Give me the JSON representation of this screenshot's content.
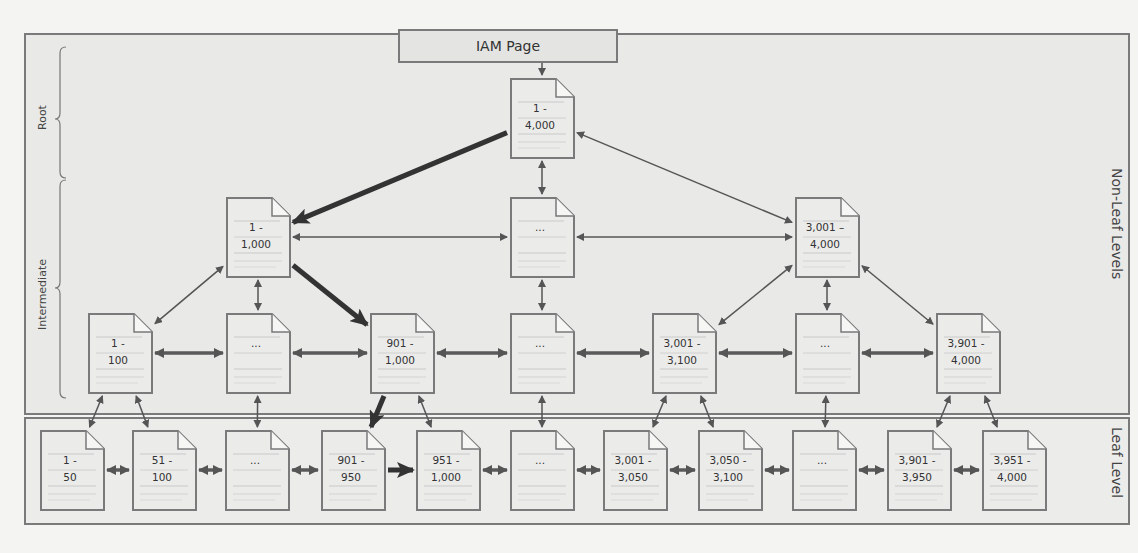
{
  "iam_page": {
    "label": "IAM Page"
  },
  "sections": {
    "non_leaf": "Non-Leaf Levels",
    "leaf": "Leaf Level",
    "root_brace": "Root",
    "intermediate_brace": "Intermediate"
  },
  "colors": {
    "border": "#7a7a7a",
    "panel": "#e9e9e7",
    "page_fill": "#ebebea",
    "arrow": "#555555",
    "bold_arrow": "#333333"
  },
  "nodes": {
    "root": {
      "label": "1 -\n4,000",
      "x": 510,
      "y": 78
    },
    "int1_a": {
      "label": "1 -\n1,000",
      "x": 226,
      "y": 197
    },
    "int1_b": {
      "label": "...",
      "x": 510,
      "y": 197
    },
    "int1_c": {
      "label": "3,001 –\n4,000",
      "x": 795,
      "y": 197
    },
    "int2_a": {
      "label": "1 -\n100",
      "x": 88,
      "y": 313
    },
    "int2_b": {
      "label": "...",
      "x": 226,
      "y": 313
    },
    "int2_c": {
      "label": "901 -\n1,000",
      "x": 370,
      "y": 313
    },
    "int2_d": {
      "label": "...",
      "x": 510,
      "y": 313
    },
    "int2_e": {
      "label": "3,001 -\n3,100",
      "x": 652,
      "y": 313
    },
    "int2_f": {
      "label": "...",
      "x": 795,
      "y": 313
    },
    "int2_g": {
      "label": "3,901 -\n4,000",
      "x": 936,
      "y": 313
    },
    "leaf_1": {
      "label": "1 -\n50",
      "x": 40,
      "y": 430
    },
    "leaf_2": {
      "label": "51 -\n100",
      "x": 132,
      "y": 430
    },
    "leaf_3": {
      "label": "...",
      "x": 225,
      "y": 430
    },
    "leaf_4": {
      "label": "901 -\n950",
      "x": 321,
      "y": 430
    },
    "leaf_5": {
      "label": "951 -\n1,000",
      "x": 416,
      "y": 430
    },
    "leaf_6": {
      "label": "...",
      "x": 510,
      "y": 430
    },
    "leaf_7": {
      "label": "3,001 -\n3,050",
      "x": 603,
      "y": 430
    },
    "leaf_8": {
      "label": "3,050 -\n3,100",
      "x": 698,
      "y": 430
    },
    "leaf_9": {
      "label": "...",
      "x": 792,
      "y": 430
    },
    "leaf_10": {
      "label": "3,901 -\n3,950",
      "x": 887,
      "y": 430
    },
    "leaf_11": {
      "label": "3,951 -\n4,000",
      "x": 982,
      "y": 430
    }
  },
  "edges": [
    {
      "from": "iam",
      "to": "root",
      "type": "single"
    },
    {
      "from": "root",
      "to": "int1_a",
      "type": "bold"
    },
    {
      "from": "root",
      "to": "int1_b",
      "type": "double"
    },
    {
      "from": "root",
      "to": "int1_c",
      "type": "double"
    },
    {
      "from": "int1_a",
      "to": "int1_b",
      "type": "double"
    },
    {
      "from": "int1_b",
      "to": "int1_c",
      "type": "double"
    },
    {
      "from": "int1_a",
      "to": "int2_a",
      "type": "double"
    },
    {
      "from": "int1_a",
      "to": "int2_b",
      "type": "double"
    },
    {
      "from": "int1_a",
      "to": "int2_c",
      "type": "bold"
    },
    {
      "from": "int1_b",
      "to": "int2_d",
      "type": "double"
    },
    {
      "from": "int1_c",
      "to": "int2_e",
      "type": "double"
    },
    {
      "from": "int1_c",
      "to": "int2_f",
      "type": "double"
    },
    {
      "from": "int1_c",
      "to": "int2_g",
      "type": "double"
    },
    {
      "from": "int2_a",
      "to": "int2_b",
      "type": "thickdouble"
    },
    {
      "from": "int2_b",
      "to": "int2_c",
      "type": "thickdouble"
    },
    {
      "from": "int2_c",
      "to": "int2_d",
      "type": "thickdouble"
    },
    {
      "from": "int2_d",
      "to": "int2_e",
      "type": "thickdouble"
    },
    {
      "from": "int2_e",
      "to": "int2_f",
      "type": "thickdouble"
    },
    {
      "from": "int2_f",
      "to": "int2_g",
      "type": "thickdouble"
    },
    {
      "from": "int2_a",
      "to": "leaf_1",
      "type": "double"
    },
    {
      "from": "int2_a",
      "to": "leaf_2",
      "type": "double"
    },
    {
      "from": "int2_b",
      "to": "leaf_3",
      "type": "double"
    },
    {
      "from": "int2_c",
      "to": "leaf_4",
      "type": "bold"
    },
    {
      "from": "int2_c",
      "to": "leaf_5",
      "type": "double"
    },
    {
      "from": "int2_d",
      "to": "leaf_6",
      "type": "double"
    },
    {
      "from": "int2_e",
      "to": "leaf_7",
      "type": "double"
    },
    {
      "from": "int2_e",
      "to": "leaf_8",
      "type": "double"
    },
    {
      "from": "int2_f",
      "to": "leaf_9",
      "type": "double"
    },
    {
      "from": "int2_g",
      "to": "leaf_10",
      "type": "double"
    },
    {
      "from": "int2_g",
      "to": "leaf_11",
      "type": "double"
    },
    {
      "from": "leaf_1",
      "to": "leaf_2",
      "type": "thickdouble"
    },
    {
      "from": "leaf_2",
      "to": "leaf_3",
      "type": "thickdouble"
    },
    {
      "from": "leaf_3",
      "to": "leaf_4",
      "type": "thickdouble"
    },
    {
      "from": "leaf_4",
      "to": "leaf_5",
      "type": "bold"
    },
    {
      "from": "leaf_5",
      "to": "leaf_6",
      "type": "thickdouble"
    },
    {
      "from": "leaf_6",
      "to": "leaf_7",
      "type": "thickdouble"
    },
    {
      "from": "leaf_7",
      "to": "leaf_8",
      "type": "thickdouble"
    },
    {
      "from": "leaf_8",
      "to": "leaf_9",
      "type": "thickdouble"
    },
    {
      "from": "leaf_9",
      "to": "leaf_10",
      "type": "thickdouble"
    },
    {
      "from": "leaf_10",
      "to": "leaf_11",
      "type": "thickdouble"
    }
  ]
}
